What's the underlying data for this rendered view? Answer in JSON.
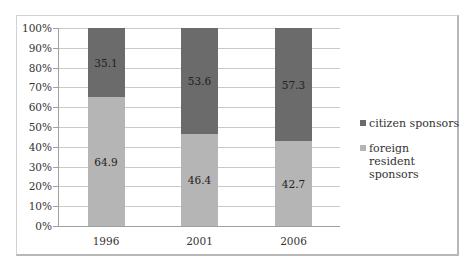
{
  "chart_data": {
    "type": "bar",
    "stacked": true,
    "percent_stacked": true,
    "title": "",
    "xlabel": "",
    "ylabel": "",
    "ylim": [
      0,
      100
    ],
    "yticks": [
      "0%",
      "10%",
      "20%",
      "30%",
      "40%",
      "50%",
      "60%",
      "70%",
      "80%",
      "90%",
      "100%"
    ],
    "categories": [
      "1996",
      "2001",
      "2006"
    ],
    "series": [
      {
        "name": "foreign resident sponsors",
        "values": [
          64.9,
          46.4,
          42.7
        ],
        "color": "#b5b5b5"
      },
      {
        "name": "citizen sponsors",
        "values": [
          35.1,
          53.6,
          57.3
        ],
        "color": "#6b6b6b"
      }
    ],
    "grid": true,
    "legend_position": "right",
    "data_labels": true
  },
  "legend": {
    "items": [
      {
        "label": "citizen sponsors",
        "color": "#6b6b6b"
      },
      {
        "label": "foreign resident sponsors",
        "color": "#b5b5b5"
      }
    ]
  }
}
